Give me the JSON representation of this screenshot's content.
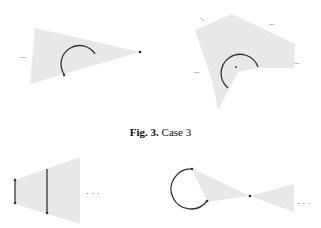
{
  "figure": {
    "caption_label": "Fig. 3.",
    "caption_text": "Case 3"
  },
  "panels": [
    {
      "name": "top-left",
      "ellipsis": "..."
    },
    {
      "name": "top-right",
      "ellipsis": [
        "...",
        "...",
        "...",
        "..."
      ]
    },
    {
      "name": "bottom-left",
      "ellipsis": "· · ·"
    },
    {
      "name": "bottom-right",
      "ellipsis": "· · ·"
    }
  ],
  "colors": {
    "region": "#e6e6e6",
    "arc": "#333333"
  }
}
